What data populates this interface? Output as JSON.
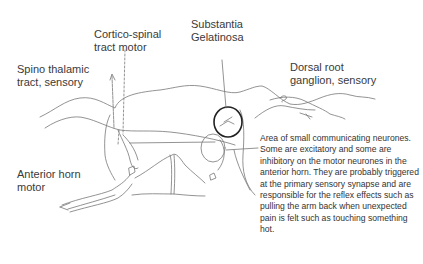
{
  "diagram": {
    "type": "hand-drawn spinal cord cross-section",
    "labels": {
      "cortico_spinal": [
        "Cortico-spinal",
        "tract motor"
      ],
      "substantia": [
        "Substantia",
        "Gelatinosa"
      ],
      "spino_thalamic": [
        "Spino thalamic",
        "tract, sensory"
      ],
      "dorsal_root": [
        "Dorsal root",
        "ganglion, sensory"
      ],
      "anterior_horn": [
        "Anterior horn",
        "motor"
      ]
    },
    "description": "Area of small communicating neurones. Some are excitatory and some are inhibitory on the motor neurones in the anterior horn. They are probably triggered at the primary sensory synapse and are responsible for the reflex effects such as pulling the arm back when unexpected pain is felt such as touching something hot.",
    "colors": {
      "text": "#333333",
      "line": "#777777",
      "background": "#ffffff"
    }
  }
}
